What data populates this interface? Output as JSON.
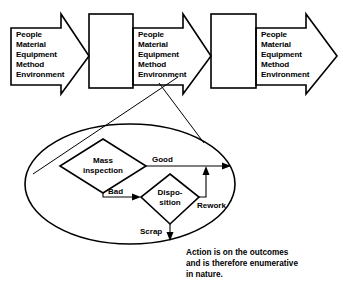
{
  "diagram": {
    "colors": {
      "stroke": "#000000",
      "background": "#ffffff"
    },
    "process_stages": [
      {
        "id": "stage-1",
        "arrow_name": "input-arrow-1",
        "inputs": [
          "People",
          "Material",
          "Equipment",
          "Method",
          "Environment"
        ],
        "box_name": "process-box-1"
      },
      {
        "id": "stage-2",
        "arrow_name": "input-arrow-2",
        "inputs": [
          "People",
          "Material",
          "Equipment",
          "Method",
          "Environment"
        ],
        "box_name": "process-box-2"
      },
      {
        "id": "stage-3",
        "arrow_name": "output-arrow-3",
        "inputs": [
          "People",
          "Material",
          "Equipment",
          "Method",
          "Environment"
        ],
        "box_name": null
      }
    ],
    "detail_callout": {
      "name": "magnifier-callout",
      "nodes": [
        {
          "id": "mass-inspection",
          "shape": "diamond",
          "label_lines": [
            "Mass",
            "inspection"
          ]
        },
        {
          "id": "disposition",
          "shape": "diamond",
          "label_lines": [
            "Dispo-",
            "sition"
          ]
        }
      ],
      "edges": [
        {
          "id": "good",
          "label": "Good",
          "from": "mass-inspection",
          "to": "output"
        },
        {
          "id": "bad",
          "label": "Bad",
          "from": "mass-inspection",
          "to": "disposition"
        },
        {
          "id": "rework",
          "label": "Rework",
          "from": "disposition",
          "to": "good"
        },
        {
          "id": "scrap",
          "label": "Scrap",
          "from": "disposition",
          "to": "discard"
        }
      ]
    },
    "caption": {
      "name": "caption-text",
      "lines": [
        "Action is on the outcomes",
        "and is therefore enumerative",
        "in nature."
      ]
    }
  }
}
